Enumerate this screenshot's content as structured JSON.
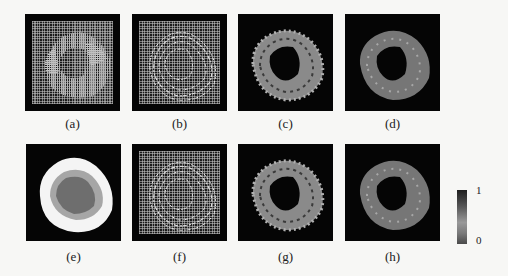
{
  "figure": {
    "panels": [
      {
        "id": "a",
        "label": "(a)",
        "description": "grid with striped ring region"
      },
      {
        "id": "b",
        "label": "(b)",
        "description": "grid with bright segmented ring"
      },
      {
        "id": "c",
        "label": "(c)",
        "description": "textured grayscale ring"
      },
      {
        "id": "d",
        "label": "(d)",
        "description": "smoother grayscale ring"
      },
      {
        "id": "e",
        "label": "(e)",
        "description": "nested layered blob (white, light gray, dark gray)"
      },
      {
        "id": "f",
        "label": "(f)",
        "description": "grid with bright segmented ring"
      },
      {
        "id": "g",
        "label": "(g)",
        "description": "textured grayscale ring"
      },
      {
        "id": "h",
        "label": "(h)",
        "description": "smoother grayscale ring"
      }
    ],
    "colorbar": {
      "max_label": "1",
      "min_label": "0"
    }
  },
  "colors": {
    "background": "#f7f7f5",
    "panel_bg": "#050505"
  }
}
